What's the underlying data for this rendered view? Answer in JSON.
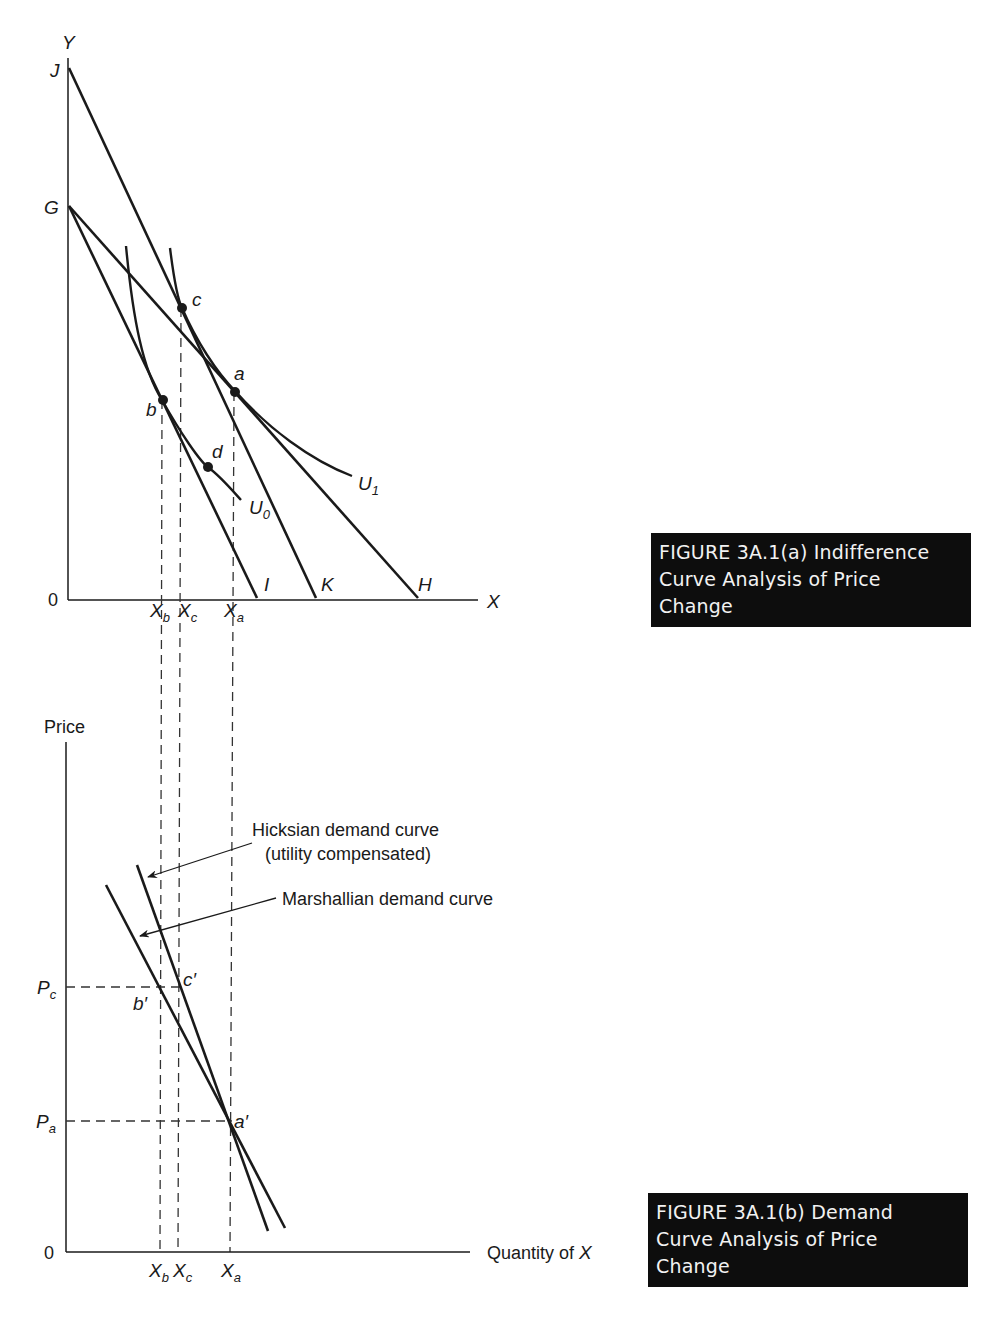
{
  "panel_a": {
    "axis_y_label": "Y",
    "axis_x_label": "X",
    "origin_label": "0",
    "intercepts": {
      "J": "J",
      "G": "G",
      "I": "I",
      "K": "K",
      "H": "H"
    },
    "points": {
      "a": "a",
      "b": "b",
      "c": "c",
      "d": "d"
    },
    "curves": {
      "U0": "U",
      "U0_sub": "0",
      "U1": "U",
      "U1_sub": "1"
    },
    "x_ticks": [
      {
        "main": "X",
        "sub": "b"
      },
      {
        "main": "X",
        "sub": "c"
      },
      {
        "main": "X",
        "sub": "a"
      }
    ],
    "caption": {
      "line1": "FIGURE 3A.1(a)  Indifference",
      "line2": "Curve Analysis of Price",
      "line3": "Change"
    }
  },
  "panel_b": {
    "axis_y_label": "Price",
    "axis_x_label": "Quantity of ",
    "axis_x_label_var": "X",
    "origin_label": "0",
    "price_ticks": [
      {
        "main": "P",
        "sub": "c"
      },
      {
        "main": "P",
        "sub": "a"
      }
    ],
    "points": {
      "a_prime": "a′",
      "b_prime": "b′",
      "c_prime": "c′"
    },
    "x_ticks": [
      {
        "main": "X",
        "sub": "b"
      },
      {
        "main": "X",
        "sub": "c"
      },
      {
        "main": "X",
        "sub": "a"
      }
    ],
    "annotations": {
      "hicksian_line1": "Hicksian demand curve",
      "hicksian_line2": "(utility compensated)",
      "marshallian": "Marshallian demand curve"
    },
    "caption": {
      "line1": "FIGURE 3A.1(b)  Demand",
      "line2": "Curve Analysis of Price",
      "line3": "Change"
    }
  },
  "colors": {
    "ink": "#1a1a1a",
    "caption_bg": "#0d0d0d",
    "caption_text": "#f2f2f2",
    "dash": "#333333"
  }
}
